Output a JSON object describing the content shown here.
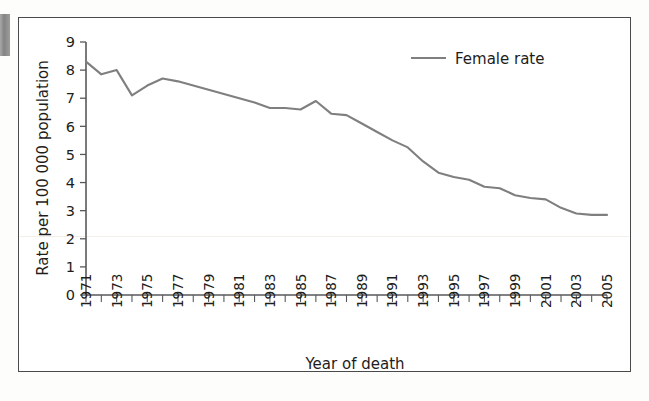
{
  "figure": {
    "background_color": "#ffffff",
    "frame_color": "#4a4a4a",
    "has_outer_frame": true
  },
  "legend": {
    "position": "top-right-inside",
    "entries": [
      {
        "label": "Female rate",
        "color": "#807f7f",
        "marker": "line"
      }
    ]
  },
  "axes": {
    "y": {
      "title": "Rate per 100 000 population",
      "ticks": [
        "0",
        "1",
        "2",
        "3",
        "4",
        "5",
        "6",
        "7",
        "8",
        "9"
      ],
      "min": 0,
      "max": 9
    },
    "x": {
      "title": "Year of death",
      "ticks": [
        "1971",
        "1973",
        "1975",
        "1977",
        "1979",
        "1981",
        "1983",
        "1985",
        "1987",
        "1989",
        "1991",
        "1993",
        "1995",
        "1997",
        "1999",
        "2001",
        "2003",
        "2005"
      ],
      "min": 1971,
      "max": 2005,
      "label_rotation": -90
    }
  },
  "chart_data": {
    "type": "line",
    "title": "",
    "xlabel": "Year of death",
    "ylabel": "Rate per 100 000 population",
    "xlim": [
      1971,
      2005
    ],
    "ylim": [
      0,
      9
    ],
    "grid": false,
    "legend_position": "top right",
    "x": [
      1971,
      1972,
      1973,
      1974,
      1975,
      1976,
      1977,
      1978,
      1979,
      1980,
      1981,
      1982,
      1983,
      1984,
      1985,
      1986,
      1987,
      1988,
      1989,
      1990,
      1991,
      1992,
      1993,
      1994,
      1995,
      1996,
      1997,
      1998,
      1999,
      2000,
      2001,
      2002,
      2003,
      2004,
      2005
    ],
    "series": [
      {
        "name": "Female rate",
        "color": "#807f7f",
        "values": [
          8.3,
          7.85,
          8.0,
          7.1,
          7.45,
          7.7,
          7.6,
          7.45,
          7.3,
          7.15,
          7.0,
          6.85,
          6.65,
          6.65,
          6.6,
          6.9,
          6.45,
          6.4,
          6.1,
          5.8,
          5.5,
          5.25,
          4.75,
          4.35,
          4.2,
          4.1,
          3.85,
          3.8,
          3.55,
          3.45,
          3.4,
          3.1,
          2.9,
          2.85,
          2.85
        ]
      }
    ]
  }
}
